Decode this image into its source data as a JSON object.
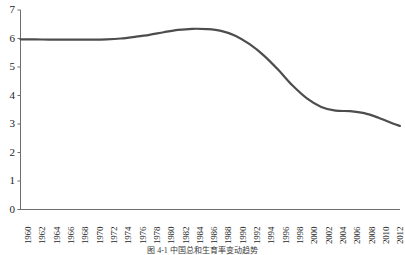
{
  "figure": {
    "caption": "图 4-1  中国总和生育率变动趋势"
  },
  "axes": {
    "y_ticks": [
      "0",
      "1",
      "2",
      "3",
      "4",
      "5",
      "6",
      "7"
    ],
    "x_ticks": [
      "1960",
      "1962",
      "1964",
      "1966",
      "1968",
      "1970",
      "1972",
      "1974",
      "1976",
      "1978",
      "1980",
      "1982",
      "1984",
      "1986",
      "1988",
      "1990",
      "1992",
      "1994",
      "1996",
      "1998",
      "2000",
      "2002",
      "2004",
      "2006",
      "2008",
      "2010",
      "2012"
    ],
    "axis_color": "#6e6e6e",
    "tick_color": "#6e6e6e"
  },
  "chart_data": {
    "type": "line",
    "title": "",
    "subtitle": "",
    "xlabel": "",
    "ylabel": "",
    "xlim": [
      1960,
      2013
    ],
    "ylim": [
      0,
      7
    ],
    "grid": false,
    "legend": null,
    "series": [
      {
        "name": "total-fertility-rate",
        "color": "#4d4d4d",
        "line_width": 2.2,
        "x": [
          1960,
          1962,
          1964,
          1966,
          1968,
          1970,
          1972,
          1974,
          1976,
          1978,
          1980,
          1982,
          1984,
          1986,
          1988,
          1990,
          1992,
          1994,
          1996,
          1998,
          2000,
          2002,
          2004,
          2006,
          2008,
          2010,
          2012,
          2013
        ],
        "values": [
          5.97,
          5.97,
          5.96,
          5.96,
          5.96,
          5.96,
          5.97,
          6.0,
          6.06,
          6.13,
          6.22,
          6.3,
          6.34,
          6.33,
          6.27,
          6.1,
          5.8,
          5.4,
          4.9,
          4.35,
          3.9,
          3.6,
          3.47,
          3.45,
          3.38,
          3.22,
          3.02,
          2.93
        ]
      }
    ]
  }
}
